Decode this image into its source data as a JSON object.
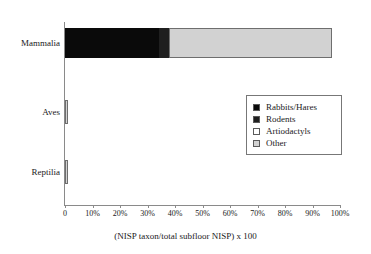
{
  "chart_data": {
    "type": "bar",
    "orientation": "horizontal",
    "stacked": true,
    "title": "",
    "xlabel": "(NISP taxon/total subfloor NISP) x 100",
    "ylabel": "",
    "xlim": [
      0,
      100
    ],
    "grid": false,
    "legend_position": "center-right",
    "categories": [
      "Mammalia",
      "Aves",
      "Reptilia"
    ],
    "xticks": [
      0,
      10,
      20,
      30,
      40,
      50,
      60,
      70,
      80,
      90,
      100
    ],
    "xtick_labels": [
      "0",
      "10%",
      "20%",
      "30%",
      "40%",
      "50%",
      "60%",
      "70%",
      "80%",
      "90%",
      "100%"
    ],
    "series": [
      {
        "name": "Rabbits/Hares",
        "color": "#0a0a0a",
        "values": [
          34.0,
          0.0,
          0.0
        ]
      },
      {
        "name": "Rodents",
        "color": "#1f1f1f",
        "values": [
          4.0,
          0.0,
          0.0
        ]
      },
      {
        "name": "Artiodactyls",
        "color": "#ffffff",
        "values": [
          0.0,
          0.0,
          0.0
        ]
      },
      {
        "name": "Other",
        "color": "#d2d2d2",
        "values": [
          59.0,
          1.0,
          1.0
        ]
      }
    ]
  },
  "legend": {
    "items": [
      {
        "label": "Rabbits/Hares",
        "color": "#0a0a0a"
      },
      {
        "label": "Rodents",
        "color": "#1f1f1f"
      },
      {
        "label": "Artiodactyls",
        "color": "#ffffff"
      },
      {
        "label": "Other",
        "color": "#d2d2d2"
      }
    ]
  },
  "axis": {
    "title": "(NISP taxon/total subfloor NISP) x 100"
  }
}
